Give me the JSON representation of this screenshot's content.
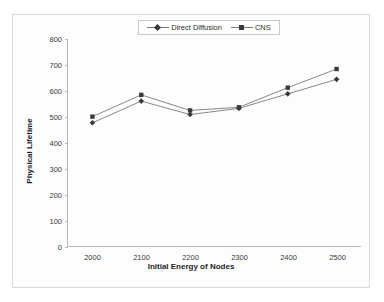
{
  "chart_data": {
    "type": "line",
    "title": "",
    "xlabel": "Initial Energy of Nodes",
    "ylabel": "Physical Lifetime",
    "categories": [
      2000,
      2100,
      2200,
      2300,
      2400,
      2500
    ],
    "x_tick_labels": [
      "2000",
      "2100",
      "2200",
      "2300",
      "2400",
      "2500"
    ],
    "y_tick_labels": [
      "0",
      "100",
      "200",
      "300",
      "400",
      "500",
      "600",
      "700",
      "800"
    ],
    "y_ticks": [
      0,
      100,
      200,
      300,
      400,
      500,
      600,
      700,
      800
    ],
    "ylim": [
      0,
      800
    ],
    "grid": false,
    "legend_position": "top-center",
    "series": [
      {
        "name": "Direct Diffusion",
        "marker": "diamond",
        "color": "#404040",
        "values": [
          476,
          560,
          508,
          532,
          588,
          644
        ]
      },
      {
        "name": "CNS",
        "marker": "square",
        "color": "#404040",
        "values": [
          500,
          584,
          524,
          536,
          612,
          684
        ]
      }
    ]
  },
  "legend": {
    "items": [
      {
        "label": "Direct Diffusion",
        "marker": "diamond"
      },
      {
        "label": "CNS",
        "marker": "square"
      }
    ]
  },
  "colors": {
    "line": "#7a7a7a",
    "marker": "#3a3a3a",
    "axis": "#b9b9b9",
    "text": "#2b2b2b",
    "frame": "#d8d8d8"
  }
}
